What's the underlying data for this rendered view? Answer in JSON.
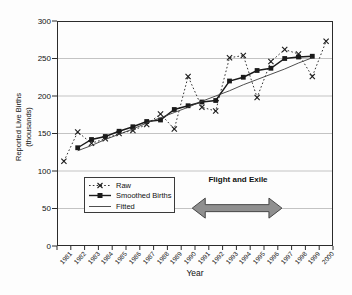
{
  "chart_data": {
    "type": "line",
    "title": "",
    "xlabel": "Year",
    "ylabel_line1": "Reported Live Births",
    "ylabel_line2": "(thousands)",
    "x": [
      1981,
      1982,
      1983,
      1984,
      1985,
      1986,
      1987,
      1988,
      1989,
      1990,
      1991,
      1992,
      1993,
      1994,
      1995,
      1996,
      1997,
      1998,
      1999,
      2000
    ],
    "ylim": [
      0,
      300
    ],
    "ytick_step": 50,
    "grid": "horizontal-gridlines",
    "legend_position": "bottom-left-inside",
    "series": [
      {
        "name": "Raw",
        "marker": "x",
        "line": "dotted",
        "values": [
          113,
          152,
          137,
          143,
          150,
          154,
          162,
          176,
          156,
          226,
          185,
          180,
          251,
          254,
          198,
          246,
          262,
          256,
          226,
          273
        ]
      },
      {
        "name": "Smoothed Births",
        "marker": "square",
        "line": "solid",
        "values": [
          null,
          131,
          142,
          146,
          153,
          159,
          166,
          168,
          182,
          187,
          192,
          194,
          220,
          225,
          234,
          237,
          250,
          252,
          253,
          null
        ]
      },
      {
        "name": "Fitted",
        "marker": "none",
        "line": "solid-thin",
        "values": [
          null,
          127,
          134,
          142,
          149,
          156,
          164,
          171,
          178,
          185,
          193,
          200,
          207,
          215,
          222,
          229,
          236,
          244,
          251,
          null
        ]
      }
    ],
    "annotation": {
      "text": "Flight and Exile",
      "arrow_span_years": [
        1990.3,
        1996.8
      ],
      "arrow_y_value": 50.5
    },
    "colors": {
      "series": "#1a1a1a",
      "fitted": "#3a3a3a",
      "grid": "#a9a9a9",
      "frame": "#2b2b2b",
      "arrow_fill": "#8f8f8f",
      "arrow_stroke": "#474747",
      "text": "#111111"
    }
  }
}
